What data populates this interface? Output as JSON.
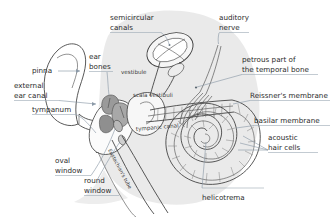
{
  "figure": {
    "background_color": "#ffffff",
    "skull_fill": "#e9e9e9",
    "tissue_fill": "#f4f4f4",
    "ink_color": "#3b3b3b",
    "leader_color": "#8c9aa8",
    "label_color": "#2b2b2b"
  },
  "labels": {
    "semicircular_canals": "semicircular\ncanals",
    "semicircular_canals_l1": "semicircular",
    "semicircular_canals_l2": "canals",
    "auditory_nerve_l1": "auditory",
    "auditory_nerve_l2": "nerve",
    "petrous_l1": "petrous part of",
    "petrous_l2": "the temporal bone",
    "reissner": "Reissner's membrane",
    "basilar": "basilar membrane",
    "acoustic_l1": "acoustic",
    "acoustic_l2": "hair cells",
    "helicotrema": "helicotrema",
    "ear_bones_l1": "ear",
    "ear_bones_l2": "bones",
    "pinna": "pinna",
    "external_l1": "external",
    "external_l2": "ear canal",
    "tympanum": "tympanum",
    "oval_l1": "oval",
    "oval_l2": "window",
    "round_l1": "round",
    "round_l2": "window",
    "vestibule": "vestibule",
    "scala_vestibuli": "scala vestibuli",
    "tympanic_canal": "tympanic canal",
    "eustachian_tube": "Eustachian's tube"
  }
}
